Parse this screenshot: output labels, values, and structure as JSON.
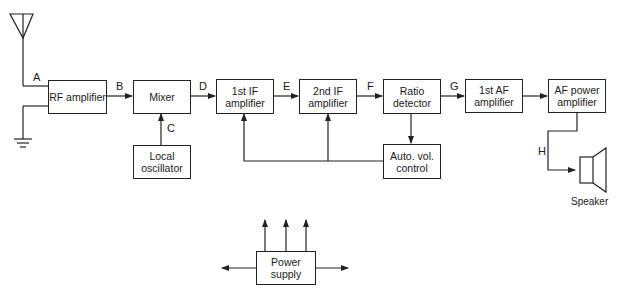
{
  "blocks": {
    "rf": "RF amplifier",
    "mixer": "Mixer",
    "lo": "Local oscillator",
    "if1": "1st IF amplifier",
    "if2": "2nd IF amplifier",
    "ratio": "Ratio detector",
    "avc": "Auto. vol. control",
    "af1": "1st AF amplifier",
    "afp": "AF power amplifier",
    "psu": "Power supply"
  },
  "signal_labels": {
    "A": "A",
    "B": "B",
    "C": "C",
    "D": "D",
    "E": "E",
    "F": "F",
    "G": "G",
    "H": "H"
  },
  "speaker_label": "Speaker",
  "icons": [
    "antenna-icon",
    "ground-icon",
    "speaker-icon"
  ],
  "colors": {
    "line": "#222222",
    "background": "#ffffff"
  }
}
